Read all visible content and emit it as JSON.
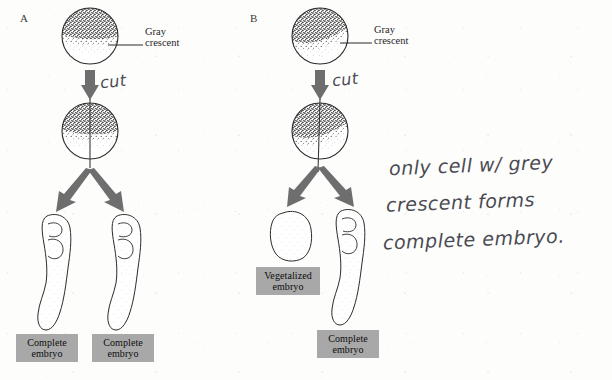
{
  "figure": {
    "title_panels": [
      {
        "letter": "A",
        "name": "panel-a"
      },
      {
        "letter": "B",
        "name": "panel-b"
      }
    ],
    "panel_a": {
      "letter": "A",
      "egg_label_line1": "Gray",
      "egg_label_line2": "crescent",
      "cut_annotation": "cut",
      "outcomes": [
        {
          "line1": "Complete",
          "line2": "embryo"
        },
        {
          "line1": "Complete",
          "line2": "embryo"
        }
      ]
    },
    "panel_b": {
      "letter": "B",
      "egg_label_line1": "Gray",
      "egg_label_line2": "crescent",
      "cut_annotation": "cut",
      "outcomes": [
        {
          "line1": "Vegetalized",
          "line2": "embryo"
        },
        {
          "line1": "Complete",
          "line2": "embryo"
        }
      ]
    },
    "handwritten_note": {
      "line1": "only cell w/ grey",
      "line2": "crescent forms",
      "line3": "complete embryo."
    },
    "colors": {
      "caption_box_bg": "#a8a8a8",
      "caption_text": "#0d0d0d",
      "arrow_fill": "#6e6e6e",
      "outline": "#2b2b2b",
      "handwriting_ink": "#4a4a52",
      "paper": "#fdfdfc",
      "stipple_dark": "#242424",
      "gray_crescent": "#b9b9b9"
    }
  }
}
